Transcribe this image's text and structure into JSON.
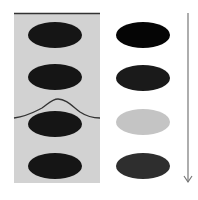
{
  "diagram": {
    "left_panel": {
      "background": "#d2d2d2",
      "top_line_color": "#333333",
      "curve_color": "#333333",
      "ellipses": [
        {
          "cy": 35,
          "color": "#151515"
        },
        {
          "cy": 77,
          "color": "#151515"
        },
        {
          "cy": 119,
          "color": "#151515"
        },
        {
          "cy": 161,
          "color": "#151515"
        }
      ]
    },
    "right_column": {
      "ellipses": [
        {
          "cy": 34,
          "color": "#050505"
        },
        {
          "cy": 77,
          "color": "#1a1a1a"
        },
        {
          "cy": 120,
          "color": "#c4c4c4"
        },
        {
          "cy": 163,
          "color": "#2e2e2e"
        }
      ]
    },
    "arrow": {
      "color": "#777777",
      "direction": "down"
    }
  }
}
